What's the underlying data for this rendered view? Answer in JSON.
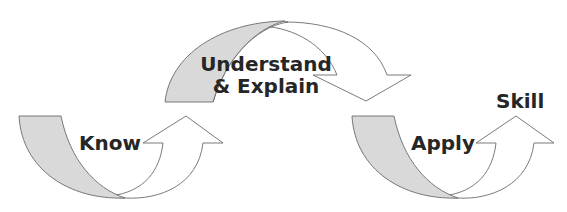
{
  "diagram": {
    "type": "process-flow",
    "stages": [
      {
        "id": "know",
        "label": "Know"
      },
      {
        "id": "understand",
        "label_line1": "Understand",
        "label_line2": "& Explain"
      },
      {
        "id": "apply",
        "label": "Apply"
      }
    ],
    "outcome": {
      "label": "Skill"
    },
    "colors": {
      "shade": "#d9d9d9",
      "stroke": "#6b6b6b",
      "text": "#262626",
      "background": "#ffffff"
    }
  }
}
